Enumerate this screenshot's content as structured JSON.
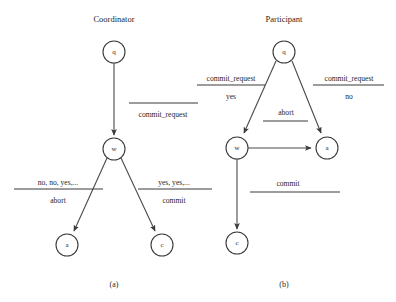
{
  "figure": {
    "panels": [
      {
        "id": "panel-a",
        "title": "Coordinator",
        "caption": "(a)",
        "nodes": [
          {
            "id": "a-q",
            "label": "q",
            "cx": 114,
            "cy": 52,
            "r": 11
          },
          {
            "id": "a-w",
            "label": "w",
            "cx": 114,
            "cy": 149,
            "r": 11
          },
          {
            "id": "a-a",
            "label": "a",
            "cx": 67,
            "cy": 245,
            "r": 11
          },
          {
            "id": "a-c",
            "label": "c",
            "cx": 162,
            "cy": 245,
            "r": 11
          }
        ],
        "edges": [
          {
            "id": "a-q-w",
            "from": "q",
            "to": "w"
          },
          {
            "id": "a-w-a",
            "from": "w",
            "to": "a"
          },
          {
            "id": "a-w-c",
            "from": "w",
            "to": "c"
          }
        ],
        "labels": [
          {
            "id": "a-label-commit-request",
            "above": "",
            "below": "commit_request"
          },
          {
            "id": "a-label-abort",
            "above": "no, no, yes,...",
            "below": "abort"
          },
          {
            "id": "a-label-commit",
            "above": "yes, yes,...",
            "below": "commit"
          }
        ]
      },
      {
        "id": "panel-b",
        "title": "Participant",
        "caption": "(b)",
        "nodes": [
          {
            "id": "b-q",
            "label": "q",
            "cx": 284,
            "cy": 52,
            "r": 11
          },
          {
            "id": "b-w",
            "label": "w",
            "cx": 237,
            "cy": 148,
            "r": 11
          },
          {
            "id": "b-a",
            "label": "a",
            "cx": 327,
            "cy": 148,
            "r": 11
          },
          {
            "id": "b-c",
            "label": "c",
            "cx": 237,
            "cy": 243,
            "r": 11
          }
        ],
        "edges": [
          {
            "id": "b-q-w",
            "from": "q",
            "to": "w"
          },
          {
            "id": "b-q-a",
            "from": "q",
            "to": "a"
          },
          {
            "id": "b-w-a",
            "from": "w",
            "to": "a"
          },
          {
            "id": "b-w-c",
            "from": "w",
            "to": "c"
          }
        ],
        "labels": [
          {
            "id": "b-label-yes",
            "above": "commit_request",
            "below": "yes"
          },
          {
            "id": "b-label-no",
            "above": "commit_request",
            "below": "no"
          },
          {
            "id": "b-label-abort",
            "above": "abort",
            "below": ""
          },
          {
            "id": "b-label-commit",
            "above": "commit",
            "below": ""
          }
        ]
      }
    ],
    "colors": {
      "stroke": "#3a3a3a",
      "edge": "#4a4a4a",
      "text": "#1f1f1f",
      "background": "#ffffff"
    }
  }
}
